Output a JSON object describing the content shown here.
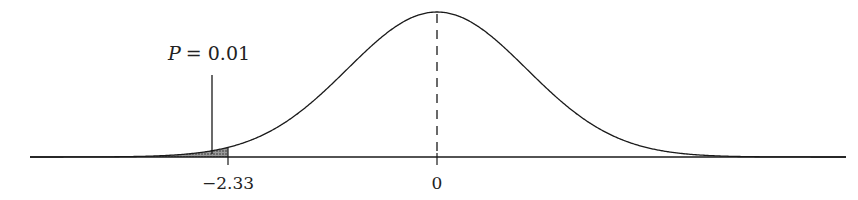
{
  "chart_data": {
    "type": "line",
    "title": "",
    "series": [
      {
        "name": "standard normal pdf",
        "mean": 0,
        "sd": 1
      }
    ],
    "x_ticks": [
      {
        "value": -2.33,
        "label": "−2.33"
      },
      {
        "value": 0,
        "label": "0"
      }
    ],
    "shaded_region": {
      "from": "-inf",
      "to": -2.33,
      "probability": 0.01
    },
    "annotations": [
      {
        "text": "P = 0.01",
        "points_to": -2.5
      }
    ],
    "mean_line": {
      "x": 0,
      "style": "dashed"
    },
    "xlabel": "",
    "ylabel": "",
    "xlim": [
      -4.5,
      4.6
    ],
    "grid": false,
    "legend": null
  },
  "labels": {
    "annotation_p": "P",
    "annotation_eq": "= 0.01",
    "tick_neg": "−2.33",
    "tick_zero": "0"
  },
  "layout": {
    "cx": 437,
    "sd_px": 89.7,
    "baseline_y": 157,
    "peak_y": 12,
    "axis_x0": 30,
    "axis_x1": 846,
    "crit_z": -2.33,
    "pointer_x": 212,
    "pointer_top": 75
  },
  "colors": {
    "line": "#1a1a1a",
    "shade": "#555555",
    "bg": "#ffffff"
  }
}
